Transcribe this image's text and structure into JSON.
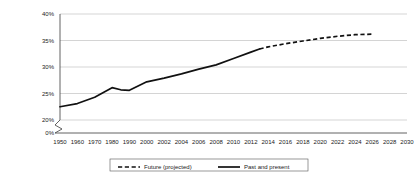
{
  "chart_data": {
    "type": "line",
    "title": "",
    "xlabel": "",
    "ylabel": "",
    "ylim": [
      0,
      40
    ],
    "y_ticks": [
      "0%",
      "20%",
      "25%",
      "30%",
      "35%",
      "40%"
    ],
    "y_tick_values": [
      0,
      20,
      25,
      30,
      35,
      40
    ],
    "y_axis_break": true,
    "grid": true,
    "x_ticks": [
      "1950",
      "1960",
      "1970",
      "1980",
      "1990",
      "2000",
      "2002",
      "2004",
      "2006",
      "2008",
      "2010",
      "2012",
      "2014",
      "2016",
      "2018",
      "2020",
      "2022",
      "2024",
      "2026",
      "2028",
      "2030"
    ],
    "legend_position": "bottom",
    "legend": [
      {
        "label": "Future (projected)",
        "style": "dashed"
      },
      {
        "label": "Past and present",
        "style": "solid"
      }
    ],
    "series": [
      {
        "name": "Past and present",
        "style": "solid",
        "points": [
          {
            "x": "1950",
            "y": 22.5
          },
          {
            "x": "1960",
            "y": 23.1
          },
          {
            "x": "1970",
            "y": 24.3
          },
          {
            "x": "1980",
            "y": 26.1
          },
          {
            "x": "1985",
            "y": 25.7
          },
          {
            "x": "1990",
            "y": 25.6
          },
          {
            "x": "2000",
            "y": 27.2
          },
          {
            "x": "2002",
            "y": 27.9
          },
          {
            "x": "2004",
            "y": 28.7
          },
          {
            "x": "2006",
            "y": 29.6
          },
          {
            "x": "2008",
            "y": 30.4
          },
          {
            "x": "2010",
            "y": 31.6
          },
          {
            "x": "2012",
            "y": 32.8
          },
          {
            "x": "2013",
            "y": 33.4
          }
        ]
      },
      {
        "name": "Future (projected)",
        "style": "dashed",
        "points": [
          {
            "x": "2013",
            "y": 33.4
          },
          {
            "x": "2014",
            "y": 33.8
          },
          {
            "x": "2016",
            "y": 34.4
          },
          {
            "x": "2018",
            "y": 34.9
          },
          {
            "x": "2020",
            "y": 35.4
          },
          {
            "x": "2022",
            "y": 35.8
          },
          {
            "x": "2024",
            "y": 36.1
          },
          {
            "x": "2026",
            "y": 36.2
          }
        ]
      }
    ]
  }
}
